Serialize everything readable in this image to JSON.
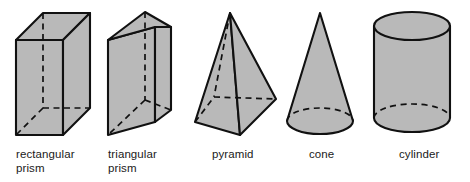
{
  "figure": {
    "background_color": "#ffffff",
    "fill_color": "#b9b9b9",
    "stroke_color": "#111111",
    "width": 470,
    "height": 182
  },
  "solids": [
    {
      "id": "rectangular-prism",
      "label": "rectangular\nprism",
      "label_line1": "rectangular",
      "label_line2": "prism",
      "shape_type": "rectangular prism",
      "visible_faces": [
        "top",
        "front",
        "right"
      ],
      "hidden_edges": 3,
      "label_x": 16,
      "label_y": 148
    },
    {
      "id": "triangular-prism",
      "label": "triangular\nprism",
      "label_line1": "triangular",
      "label_line2": "prism",
      "shape_type": "triangular prism",
      "visible_faces": [
        "top-triangle",
        "front",
        "right"
      ],
      "hidden_edges": 3,
      "label_x": 108,
      "label_y": 148
    },
    {
      "id": "pyramid",
      "label": "pyramid",
      "label_line1": "pyramid",
      "label_line2": "",
      "shape_type": "square pyramid",
      "visible_faces": [
        "left",
        "right"
      ],
      "hidden_edges": 3,
      "label_x": 212,
      "label_y": 148
    },
    {
      "id": "cone",
      "label": "cone",
      "label_line1": "cone",
      "label_line2": "",
      "shape_type": "cone",
      "visible_faces": [
        "lateral"
      ],
      "hidden_edges": 1,
      "label_x": 309,
      "label_y": 148
    },
    {
      "id": "cylinder",
      "label": "cylinder",
      "label_line1": "cylinder",
      "label_line2": "",
      "shape_type": "cylinder",
      "visible_faces": [
        "top-ellipse",
        "lateral"
      ],
      "hidden_edges": 1,
      "label_x": 399,
      "label_y": 148
    }
  ]
}
